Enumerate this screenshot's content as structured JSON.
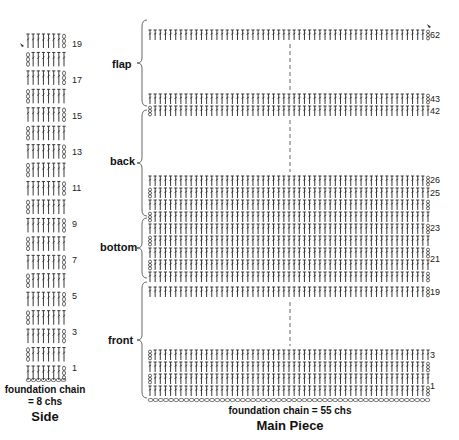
{
  "side": {
    "row_labels": [
      "19",
      "17",
      "15",
      "13",
      "11",
      "9",
      "7",
      "5",
      "3",
      "1"
    ],
    "caption_line1": "foundation chain",
    "caption_line2": "= 8 chs",
    "title": "Side",
    "stitches_per_row": 8,
    "rows": 19
  },
  "main": {
    "sections": {
      "flap": "flap",
      "back": "back",
      "bottom": "bottom",
      "front": "front"
    },
    "row_labels": {
      "r62": "62",
      "r43": "43",
      "r42": "42",
      "r26": "26",
      "r25": "25",
      "r23": "23",
      "r21": "21",
      "r19": "19",
      "r3": "3",
      "r1": "1"
    },
    "caption": "foundation chain = 55 chs",
    "title": "Main Piece",
    "stitches_per_row": 55
  },
  "colors": {
    "ink": "#222222",
    "dash": "#555555"
  }
}
